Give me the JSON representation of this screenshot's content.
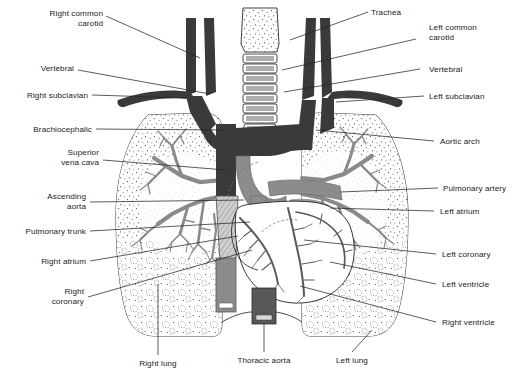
{
  "figure": {
    "type": "anatomical-diagram",
    "colors": {
      "background": "#ffffff",
      "line": "#262626",
      "vessel_dark": "#3a3a3a",
      "vessel_mid": "#7f7f7f",
      "vessel_light": "#9a9a9a",
      "lung_fill": "#ffffff",
      "stipple": "#4a4a4a",
      "text": "#1a1a1a"
    }
  },
  "labels": {
    "left": [
      {
        "id": "right-common-carotid",
        "text": "Right common",
        "text2": "carotid"
      },
      {
        "id": "vertebral-left-col",
        "text": "Vertebral",
        "text2": ""
      },
      {
        "id": "right-subclavian",
        "text": "Right subclavian",
        "text2": ""
      },
      {
        "id": "brachiocephalic",
        "text": "Brachiocephalic",
        "text2": ""
      },
      {
        "id": "superior-vena-cava",
        "text": "Superior",
        "text2": "vena cava"
      },
      {
        "id": "ascending-aorta",
        "text": "Ascending",
        "text2": "aorta"
      },
      {
        "id": "pulmonary-trunk",
        "text": "Pulmonary trunk",
        "text2": ""
      },
      {
        "id": "right-atrium",
        "text": "Right atrium",
        "text2": ""
      },
      {
        "id": "right-coronary",
        "text": "Right",
        "text2": "coronary"
      }
    ],
    "right": [
      {
        "id": "trachea",
        "text": "Trachea",
        "text2": ""
      },
      {
        "id": "left-common-carotid",
        "text": "Left common",
        "text2": "carotid"
      },
      {
        "id": "vertebral",
        "text": "Vertebral",
        "text2": ""
      },
      {
        "id": "left-subclavian",
        "text": "Left subclavian",
        "text2": ""
      },
      {
        "id": "aortic-arch",
        "text": "Aortic arch",
        "text2": ""
      },
      {
        "id": "pulmonary-artery",
        "text": "Pulmonary artery",
        "text2": ""
      },
      {
        "id": "left-atrium",
        "text": "Left atrium",
        "text2": ""
      },
      {
        "id": "left-coronary",
        "text": "Left coronary",
        "text2": ""
      },
      {
        "id": "left-ventricle",
        "text": "Left ventricle",
        "text2": ""
      },
      {
        "id": "right-ventricle",
        "text": "Right ventricle",
        "text2": ""
      }
    ],
    "bottom": [
      {
        "id": "right-lung",
        "text": "Right lung"
      },
      {
        "id": "thoracic-aorta",
        "text": "Thoracic aorta"
      },
      {
        "id": "left-lung",
        "text": "Left lung"
      }
    ]
  }
}
